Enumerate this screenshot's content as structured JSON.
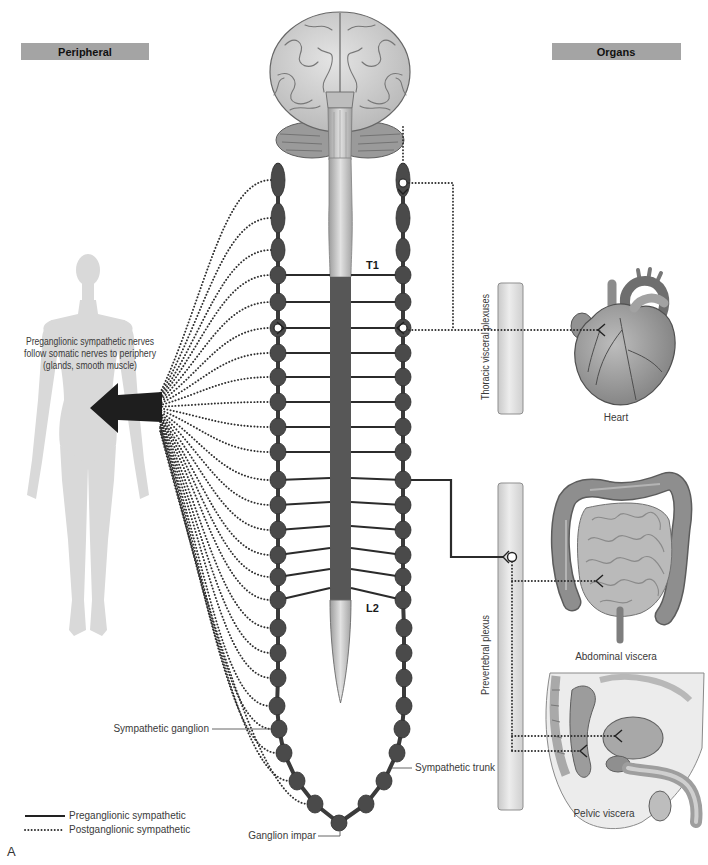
{
  "headers": {
    "peripheral": "Peripheral",
    "organs": "Organs"
  },
  "periphery": {
    "note_lines": [
      "Preganglionic sympathetic nerves",
      "follow somatic nerves to periphery",
      "(glands, smooth muscle)"
    ]
  },
  "spinal_levels": {
    "upper": "T1",
    "lower": "L2"
  },
  "labels": {
    "sympathetic_ganglion": "Sympathetic ganglion",
    "sympathetic_trunk": "Sympathetic trunk",
    "ganglion_impar": "Ganglion impar"
  },
  "plexuses": {
    "thoracic": "Thoracic visceral plexuses",
    "prevertebral": "Prevertebral plexus"
  },
  "organs": {
    "heart": "Heart",
    "abdominal": "Abdominal viscera",
    "pelvic": "Pelvic viscera"
  },
  "legend": {
    "items": [
      {
        "label": "Preganglionic sympathetic",
        "style": "solid"
      },
      {
        "label": "Postganglionic sympathetic",
        "style": "dotted"
      }
    ]
  },
  "panel_label": "A",
  "colors": {
    "ganglion": "#4a4a4a",
    "ganglion_stroke": "#2e2e2e",
    "trunk": "#3b3b3b",
    "cord_dark": "#575757",
    "header_bg": "#a4a4a4",
    "figure": "#d9d9d9"
  }
}
